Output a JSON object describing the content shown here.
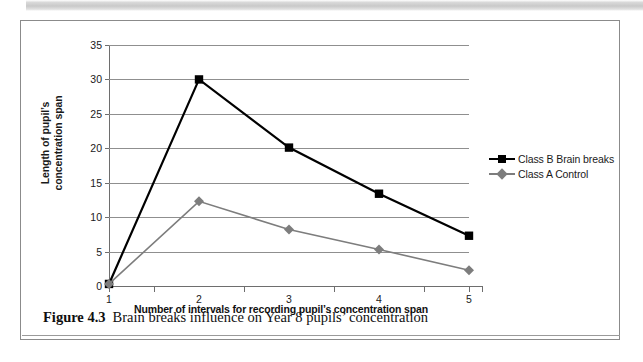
{
  "figure": {
    "caption_label": "Figure 4.3",
    "caption_text": "Brain breaks influence on Year 8 pupils’ concentration"
  },
  "colors": {
    "series_b": "#000000",
    "series_a": "#7d7d7d",
    "gridline": "#8f8f8f",
    "axis": "#6e6e6e",
    "frame": "#8b8b8b",
    "text": "#1a1a1a"
  },
  "axis": {
    "y_title_line1": "Length of pupil’s",
    "y_title_line2": "concentration span",
    "x_title": "Number of intervals for recording pupil’s concentration span",
    "y_ticks": [
      "0",
      "5",
      "10",
      "15",
      "20",
      "25",
      "30",
      "35"
    ],
    "x_ticks": [
      "1",
      "2",
      "3",
      "4",
      "5"
    ]
  },
  "legend": {
    "items": [
      {
        "label": "Class B Brain breaks",
        "marker": "square-marker",
        "color": "#000000"
      },
      {
        "label": "Class A Control",
        "marker": "diamond-marker",
        "color": "#7d7d7d"
      }
    ]
  },
  "chart_data": {
    "type": "line",
    "title": "Brain breaks influence on Year 8 pupils’ concentration",
    "xlabel": "Number of intervals for recording pupil’s concentration span",
    "ylabel": "Length of pupil’s concentration span",
    "categories": [
      1,
      2,
      3,
      4,
      5
    ],
    "x": [
      1,
      2,
      3,
      4,
      5
    ],
    "xlim": [
      1,
      5
    ],
    "ylim": [
      0,
      35
    ],
    "y_ticks": [
      0,
      5,
      10,
      15,
      20,
      25,
      30,
      35
    ],
    "grid": true,
    "legend_position": "right",
    "series": [
      {
        "name": "Class B Brain breaks",
        "color": "#000000",
        "marker": "square",
        "values": [
          0.3,
          30.0,
          20.1,
          13.4,
          7.3
        ]
      },
      {
        "name": "Class A Control",
        "color": "#7d7d7d",
        "marker": "diamond",
        "values": [
          0.3,
          12.3,
          8.2,
          5.3,
          2.3
        ]
      }
    ]
  }
}
